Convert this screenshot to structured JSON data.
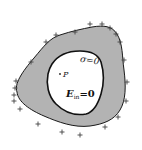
{
  "diagram": {
    "type": "conductor-with-cavity",
    "colors": {
      "background": "#ffffff",
      "conductor_fill": "#b3b3b3",
      "cavity_fill": "#ffffff",
      "outline": "#1a1a1a",
      "charge_marks": "#444444"
    },
    "labels": {
      "surface_charge": "σ=0",
      "point": "P",
      "field": "E",
      "field_subscript": "in",
      "field_value": "=0"
    },
    "charges": {
      "sign": "+",
      "positions": [
        [
          90,
          24
        ],
        [
          102,
          24
        ],
        [
          110,
          28
        ],
        [
          116,
          34
        ],
        [
          120,
          42
        ],
        [
          124,
          60
        ],
        [
          127,
          82
        ],
        [
          126,
          101
        ],
        [
          118,
          117
        ],
        [
          105,
          127
        ],
        [
          80,
          135
        ],
        [
          62,
          132
        ],
        [
          38,
          124
        ],
        [
          20,
          109
        ],
        [
          14,
          101
        ],
        [
          14,
          95
        ],
        [
          15,
          88
        ],
        [
          16,
          81
        ],
        [
          31,
          62
        ],
        [
          46,
          42
        ],
        [
          56,
          35
        ],
        [
          75,
          32
        ]
      ]
    }
  }
}
